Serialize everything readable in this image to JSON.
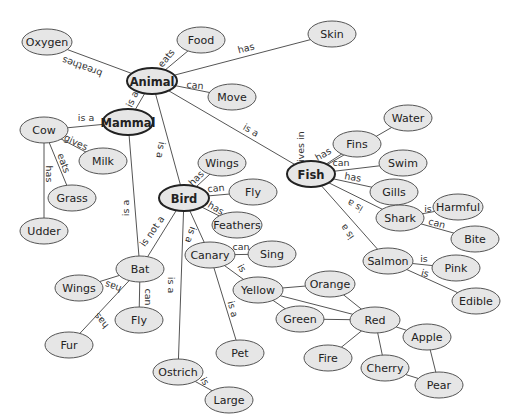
{
  "diagram": {
    "type": "concept-map",
    "colors": {
      "node_fill": "#e6e6e6",
      "node_stroke": "#555555",
      "main_stroke": "#222222",
      "edge": "#555555",
      "background": "#ffffff"
    },
    "nodes": [
      {
        "id": "oxygen",
        "label": "Oxygen",
        "x": 47,
        "y": 42,
        "rx": 25,
        "ry": 13
      },
      {
        "id": "food",
        "label": "Food",
        "x": 201,
        "y": 40,
        "rx": 24,
        "ry": 13
      },
      {
        "id": "skin",
        "label": "Skin",
        "x": 332,
        "y": 34,
        "rx": 24,
        "ry": 13
      },
      {
        "id": "animal",
        "label": "Animal",
        "x": 152,
        "y": 81,
        "rx": 25,
        "ry": 13,
        "main": true
      },
      {
        "id": "move",
        "label": "Move",
        "x": 232,
        "y": 97,
        "rx": 24,
        "ry": 13
      },
      {
        "id": "mammal",
        "label": "Mammal",
        "x": 128,
        "y": 122,
        "rx": 25,
        "ry": 13,
        "main": true
      },
      {
        "id": "cow",
        "label": "Cow",
        "x": 44,
        "y": 130,
        "rx": 24,
        "ry": 13
      },
      {
        "id": "milk",
        "label": "Milk",
        "x": 103,
        "y": 161,
        "rx": 24,
        "ry": 13
      },
      {
        "id": "grass",
        "label": "Grass",
        "x": 72,
        "y": 198,
        "rx": 24,
        "ry": 13
      },
      {
        "id": "udder",
        "label": "Udder",
        "x": 44,
        "y": 231,
        "rx": 24,
        "ry": 13
      },
      {
        "id": "water",
        "label": "Water",
        "x": 408,
        "y": 118,
        "rx": 24,
        "ry": 13
      },
      {
        "id": "fins",
        "label": "Fins",
        "x": 357,
        "y": 144,
        "rx": 24,
        "ry": 13
      },
      {
        "id": "swim",
        "label": "Swim",
        "x": 403,
        "y": 163,
        "rx": 24,
        "ry": 13
      },
      {
        "id": "fish",
        "label": "Fish",
        "x": 311,
        "y": 174,
        "rx": 24,
        "ry": 13,
        "main": true
      },
      {
        "id": "gills",
        "label": "Gills",
        "x": 394,
        "y": 192,
        "rx": 24,
        "ry": 13
      },
      {
        "id": "harmful",
        "label": "Harmful",
        "x": 458,
        "y": 207,
        "rx": 25,
        "ry": 13
      },
      {
        "id": "shark",
        "label": "Shark",
        "x": 400,
        "y": 218,
        "rx": 24,
        "ry": 13
      },
      {
        "id": "bite",
        "label": "Bite",
        "x": 475,
        "y": 239,
        "rx": 24,
        "ry": 13
      },
      {
        "id": "wings_bird",
        "label": "Wings",
        "x": 222,
        "y": 163,
        "rx": 24,
        "ry": 13
      },
      {
        "id": "fly_bird",
        "label": "Fly",
        "x": 253,
        "y": 192,
        "rx": 24,
        "ry": 13
      },
      {
        "id": "bird",
        "label": "Bird",
        "x": 184,
        "y": 198,
        "rx": 25,
        "ry": 13,
        "main": true
      },
      {
        "id": "feathers",
        "label": "Feathers",
        "x": 237,
        "y": 225,
        "rx": 25,
        "ry": 13
      },
      {
        "id": "canary",
        "label": "Canary",
        "x": 210,
        "y": 255,
        "rx": 25,
        "ry": 13
      },
      {
        "id": "sing",
        "label": "Sing",
        "x": 272,
        "y": 254,
        "rx": 24,
        "ry": 13
      },
      {
        "id": "salmon",
        "label": "Salmon",
        "x": 388,
        "y": 261,
        "rx": 25,
        "ry": 13
      },
      {
        "id": "pink",
        "label": "Pink",
        "x": 456,
        "y": 268,
        "rx": 24,
        "ry": 13
      },
      {
        "id": "edible",
        "label": "Edible",
        "x": 476,
        "y": 301,
        "rx": 24,
        "ry": 13
      },
      {
        "id": "bat",
        "label": "Bat",
        "x": 140,
        "y": 269,
        "rx": 24,
        "ry": 13
      },
      {
        "id": "wings_bat",
        "label": "Wings",
        "x": 79,
        "y": 288,
        "rx": 24,
        "ry": 13
      },
      {
        "id": "fly_bat",
        "label": "Fly",
        "x": 139,
        "y": 320,
        "rx": 24,
        "ry": 13
      },
      {
        "id": "fur",
        "label": "Fur",
        "x": 69,
        "y": 345,
        "rx": 24,
        "ry": 13
      },
      {
        "id": "yellow",
        "label": "Yellow",
        "x": 258,
        "y": 290,
        "rx": 25,
        "ry": 13
      },
      {
        "id": "orange",
        "label": "Orange",
        "x": 330,
        "y": 284,
        "rx": 25,
        "ry": 13
      },
      {
        "id": "green",
        "label": "Green",
        "x": 300,
        "y": 319,
        "rx": 24,
        "ry": 13
      },
      {
        "id": "red",
        "label": "Red",
        "x": 375,
        "y": 320,
        "rx": 25,
        "ry": 13
      },
      {
        "id": "apple",
        "label": "Apple",
        "x": 427,
        "y": 337,
        "rx": 24,
        "ry": 13
      },
      {
        "id": "fire",
        "label": "Fire",
        "x": 328,
        "y": 358,
        "rx": 24,
        "ry": 13
      },
      {
        "id": "cherry",
        "label": "Cherry",
        "x": 385,
        "y": 368,
        "rx": 24,
        "ry": 13
      },
      {
        "id": "pear",
        "label": "Pear",
        "x": 439,
        "y": 385,
        "rx": 24,
        "ry": 13
      },
      {
        "id": "pet",
        "label": "Pet",
        "x": 240,
        "y": 353,
        "rx": 24,
        "ry": 13
      },
      {
        "id": "ostrich",
        "label": "Ostrich",
        "x": 178,
        "y": 372,
        "rx": 25,
        "ry": 13
      },
      {
        "id": "large",
        "label": "Large",
        "x": 229,
        "y": 400,
        "rx": 24,
        "ry": 13
      }
    ],
    "edges": [
      {
        "from": "animal",
        "to": "oxygen",
        "label": "breathes",
        "lx": 82,
        "ly": 67,
        "angle": 200
      },
      {
        "from": "animal",
        "to": "food",
        "label": "eats",
        "lx": 166,
        "ly": 58,
        "angle": -50
      },
      {
        "from": "animal",
        "to": "skin",
        "label": "has",
        "lx": 246,
        "ly": 48,
        "angle": -15
      },
      {
        "from": "animal",
        "to": "move",
        "label": "can",
        "lx": 195,
        "ly": 85,
        "angle": 5
      },
      {
        "from": "animal",
        "to": "mammal",
        "label": "is a",
        "lx": 132,
        "ly": 99,
        "angle": -65
      },
      {
        "from": "animal",
        "to": "bird",
        "label": "is a",
        "lx": 161,
        "ly": 150,
        "angle": 100
      },
      {
        "from": "animal",
        "to": "fish",
        "label": "is a",
        "lx": 251,
        "ly": 130,
        "angle": 30
      },
      {
        "from": "mammal",
        "to": "cow",
        "label": "is a",
        "lx": 86,
        "ly": 117,
        "angle": 0
      },
      {
        "from": "cow",
        "to": "milk",
        "label": "gives",
        "lx": 76,
        "ly": 142,
        "angle": 25
      },
      {
        "from": "cow",
        "to": "grass",
        "label": "eats",
        "lx": 64,
        "ly": 163,
        "angle": 70
      },
      {
        "from": "cow",
        "to": "udder",
        "label": "has",
        "lx": 49,
        "ly": 174,
        "angle": 90
      },
      {
        "from": "mammal",
        "to": "bat",
        "label": "is a",
        "lx": 125,
        "ly": 208,
        "angle": -90
      },
      {
        "from": "bird",
        "to": "bat",
        "label": "is not a",
        "lx": 152,
        "ly": 231,
        "angle": -55
      },
      {
        "from": "bird",
        "to": "wings_bird",
        "label": "has",
        "lx": 196,
        "ly": 178,
        "angle": -45
      },
      {
        "from": "bird",
        "to": "fly_bird",
        "label": "can",
        "lx": 216,
        "ly": 188,
        "angle": -5
      },
      {
        "from": "bird",
        "to": "feathers",
        "label": "has",
        "lx": 216,
        "ly": 208,
        "angle": 30
      },
      {
        "from": "bird",
        "to": "canary",
        "label": "is a",
        "lx": 191,
        "ly": 235,
        "angle": 110
      },
      {
        "from": "bird",
        "to": "ostrich",
        "label": "is a",
        "lx": 171,
        "ly": 285,
        "angle": 90
      },
      {
        "from": "canary",
        "to": "sing",
        "label": "can",
        "lx": 241,
        "ly": 246,
        "angle": 0
      },
      {
        "from": "canary",
        "to": "yellow",
        "label": "is",
        "lx": 242,
        "ly": 268,
        "angle": 60
      },
      {
        "from": "canary",
        "to": "pet",
        "label": "is a",
        "lx": 233,
        "ly": 309,
        "angle": 75
      },
      {
        "from": "ostrich",
        "to": "large",
        "label": "is",
        "lx": 205,
        "ly": 381,
        "angle": 60
      },
      {
        "from": "bat",
        "to": "wings_bat",
        "label": "has",
        "lx": 113,
        "ly": 287,
        "angle": 200
      },
      {
        "from": "bat",
        "to": "fly_bat",
        "label": "can",
        "lx": 148,
        "ly": 297,
        "angle": 90
      },
      {
        "from": "bat",
        "to": "fur",
        "label": "has",
        "lx": 101,
        "ly": 321,
        "angle": 230
      },
      {
        "from": "fish",
        "to": "water",
        "label": "lives in",
        "lx": 300,
        "ly": 148,
        "angle": -90
      },
      {
        "from": "fish",
        "to": "fins",
        "label": "has",
        "lx": 323,
        "ly": 154,
        "angle": -30
      },
      {
        "from": "fish",
        "to": "swim",
        "label": "can",
        "lx": 341,
        "ly": 162,
        "angle": 0
      },
      {
        "from": "fish",
        "to": "gills",
        "label": "has",
        "lx": 353,
        "ly": 177,
        "angle": 10
      },
      {
        "from": "fish",
        "to": "shark",
        "label": "is a",
        "lx": 355,
        "ly": 206,
        "angle": 210
      },
      {
        "from": "fish",
        "to": "salmon",
        "label": "is a",
        "lx": 347,
        "ly": 232,
        "angle": 235
      },
      {
        "from": "shark",
        "to": "harmful",
        "label": "is",
        "lx": 428,
        "ly": 208,
        "angle": 0
      },
      {
        "from": "shark",
        "to": "bite",
        "label": "can",
        "lx": 437,
        "ly": 223,
        "angle": 15
      },
      {
        "from": "salmon",
        "to": "pink",
        "label": "is",
        "lx": 424,
        "ly": 258,
        "angle": 0
      },
      {
        "from": "salmon",
        "to": "edible",
        "label": "is",
        "lx": 425,
        "ly": 273,
        "angle": 15
      },
      {
        "from": "yellow",
        "to": "orange",
        "label": ""
      },
      {
        "from": "yellow",
        "to": "green",
        "label": ""
      },
      {
        "from": "yellow",
        "to": "red",
        "label": ""
      },
      {
        "from": "orange",
        "to": "red",
        "label": ""
      },
      {
        "from": "green",
        "to": "red",
        "label": ""
      },
      {
        "from": "red",
        "to": "apple",
        "label": ""
      },
      {
        "from": "red",
        "to": "fire",
        "label": ""
      },
      {
        "from": "red",
        "to": "cherry",
        "label": ""
      },
      {
        "from": "apple",
        "to": "pear",
        "label": ""
      },
      {
        "from": "cherry",
        "to": "pear",
        "label": ""
      }
    ]
  }
}
